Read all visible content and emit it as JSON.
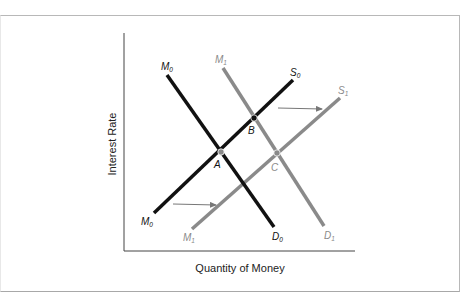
{
  "diagram": {
    "axes": {
      "x_label": "Quantity of Money",
      "y_label": "Interest Rate"
    },
    "colors": {
      "original": "#111111",
      "shifted": "#8a8a8a",
      "axis": "#444444",
      "frame": "#b8b8b8"
    },
    "curves": [
      {
        "id": "M0-D0",
        "top_label": "M",
        "top_sub": "0",
        "bottom_label": "D",
        "bottom_sub": "0",
        "color": "original",
        "description": "Original money demand"
      },
      {
        "id": "M1-D1",
        "top_label": "M",
        "top_sub": "1",
        "bottom_label": "D",
        "bottom_sub": "1",
        "color": "shifted",
        "description": "Shifted money demand"
      },
      {
        "id": "M0-S0",
        "top_label": "S",
        "top_sub": "0",
        "bottom_label": "M",
        "bottom_sub": "0",
        "color": "original",
        "description": "Original money supply"
      },
      {
        "id": "M1-S1",
        "top_label": "S",
        "top_sub": "1",
        "bottom_label": "M",
        "bottom_sub": "1",
        "color": "shifted",
        "description": "Shifted money supply"
      }
    ],
    "points": [
      {
        "label": "A",
        "color": "shifted"
      },
      {
        "label": "B",
        "color": "original"
      },
      {
        "label": "C",
        "color": "shifted"
      }
    ],
    "arrows": [
      {
        "id": "upper-shift-arrow",
        "direction": "right"
      },
      {
        "id": "lower-shift-arrow",
        "direction": "right"
      }
    ]
  }
}
